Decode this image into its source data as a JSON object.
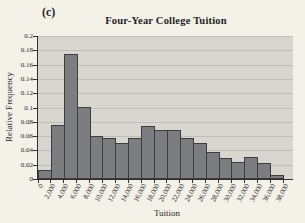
{
  "figure_label": "(c)",
  "chart_data": {
    "type": "bar",
    "subtype": "histogram",
    "title": "Four-Year College Tuition",
    "xlabel": "Tuition",
    "ylabel": "Relative Frequency",
    "ylim": [
      0,
      0.2
    ],
    "ytick_step": 0.02,
    "ytick_labels": [
      "0.2",
      "0.18",
      "0.16",
      "0.14",
      "0.12",
      "0.1",
      "0.08",
      "0.06",
      "0.04",
      "0.02",
      "0"
    ],
    "xtick_labels": [
      "0",
      "2,000",
      "4,000",
      "6,000",
      "8,000",
      "10,000",
      "12,000",
      "14,000",
      "16,000",
      "18,000",
      "20,000",
      "22,000",
      "24,000",
      "26,000",
      "28,000",
      "30,000",
      "32,000",
      "34,000",
      "36,000",
      "38,000"
    ],
    "bin_width": 2000,
    "categories": [
      "0-2,000",
      "2,000-4,000",
      "4,000-6,000",
      "6,000-8,000",
      "8,000-10,000",
      "10,000-12,000",
      "12,000-14,000",
      "14,000-16,000",
      "16,000-18,000",
      "18,000-20,000",
      "20,000-22,000",
      "22,000-24,000",
      "24,000-26,000",
      "26,000-28,000",
      "28,000-30,000",
      "30,000-32,000",
      "32,000-34,000",
      "34,000-36,000",
      "36,000-38,000"
    ],
    "values": [
      0.013,
      0.075,
      0.175,
      0.1,
      0.06,
      0.057,
      0.051,
      0.057,
      0.074,
      0.069,
      0.069,
      0.058,
      0.05,
      0.038,
      0.029,
      0.024,
      0.031,
      0.022,
      0.005
    ],
    "grid": true,
    "legend": false,
    "colors": {
      "page_bg": "#f4f1e9",
      "plot_bg": "#d8d6cf",
      "gridline": "#bfbdb6",
      "bar_fill": "#7b7d80",
      "bar_border": "#3c3d40",
      "axis": "#2f2f2f",
      "text": "#1f1f1f"
    }
  }
}
